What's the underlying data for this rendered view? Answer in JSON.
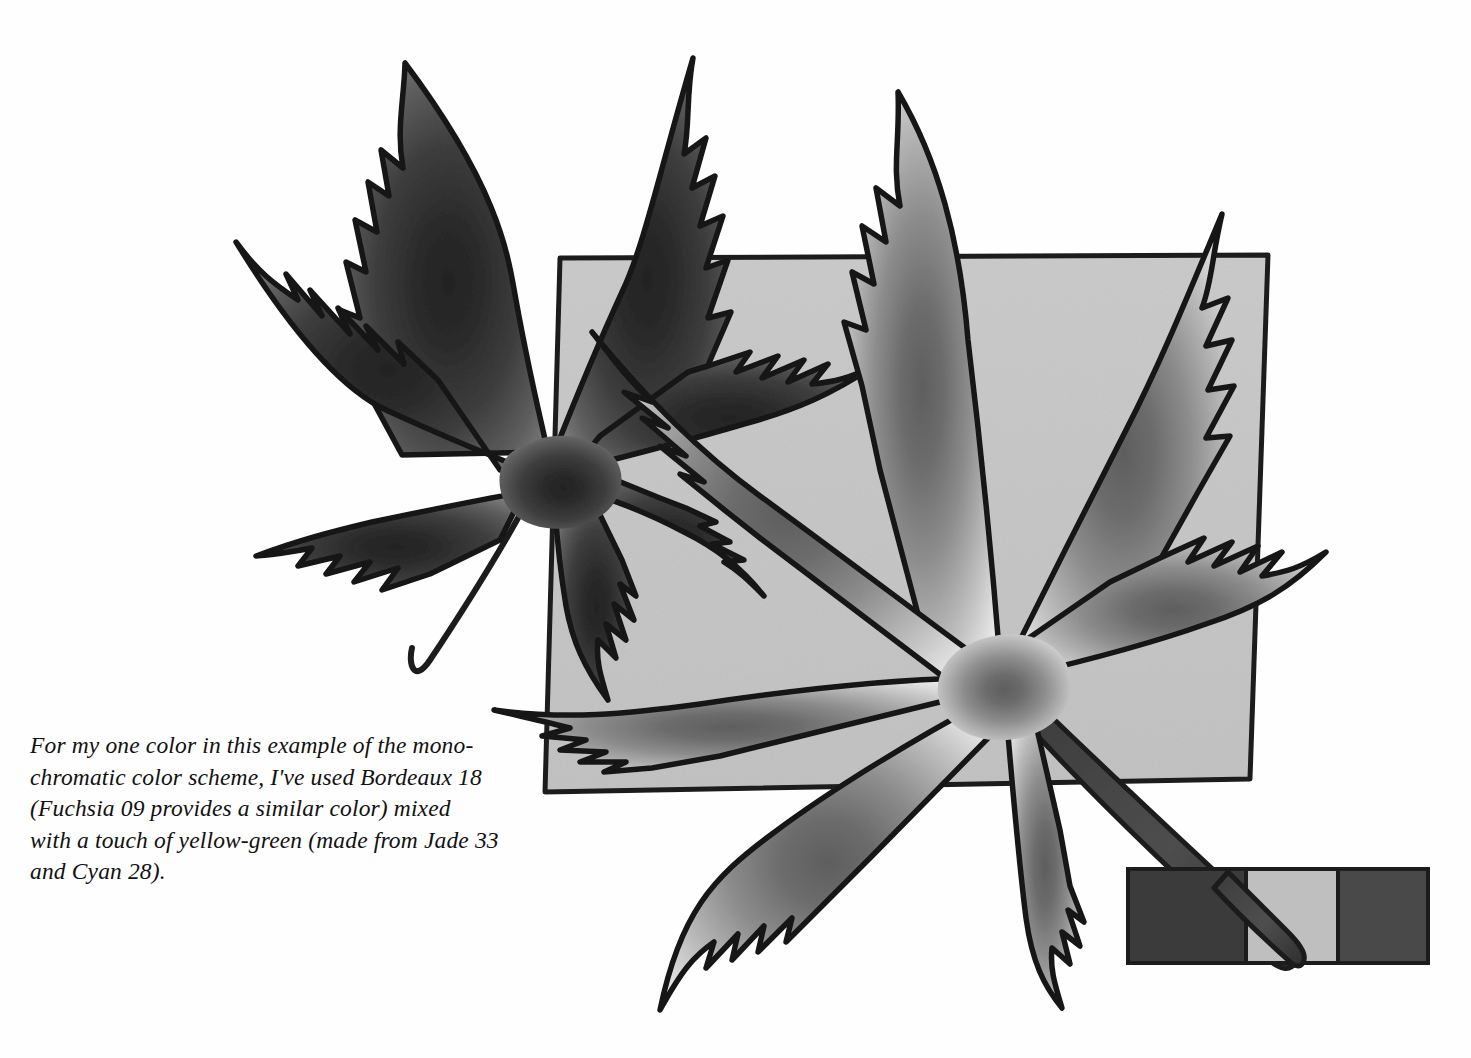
{
  "page": {
    "kind": "book-illustration-plate",
    "background_color": "#fefefe",
    "width": 1471,
    "height": 1058
  },
  "caption": {
    "text": "For my one color in this example of the mono-\nchromatic color scheme, I've used Bordeaux 18\n(Fuchsia 09 provides a similar color) mixed\nwith a touch of yellow-green (made from Jade 33\nand Cyan 28).",
    "lines": [
      "For my one color in this example of the mono-",
      "chromatic color scheme, I've used Bordeaux 18",
      "(Fuchsia 09 provides a similar color) mixed",
      "with a touch of yellow-green (made from Jade 33",
      "and Cyan 28)."
    ],
    "style": "italic-serif",
    "color": "#111111"
  },
  "artwork": {
    "title": "two-japanese-maple-leaves-over-gray-square",
    "background_square": {
      "fill": "#c7c7c7",
      "stroke": "#1a1a1a",
      "corners": "545,792 560,258 1268,255 1250,779"
    },
    "leaves": [
      {
        "name": "dark-leaf-upper-left",
        "tone": "dark",
        "center_fill": "#2a2a2a",
        "tip_fill": "#8d8d8d",
        "outline": "#141414",
        "stem": "thin-curved-down-left"
      },
      {
        "name": "light-leaf-lower-right",
        "tone": "light",
        "center_fill": "#6e6e6e",
        "tip_fill": "#f2f2f2",
        "outline": "#141414",
        "stem": "thick-tapered-down-right"
      }
    ]
  },
  "swatch_bar": {
    "name": "monochromatic-color-swatch-strip",
    "cells": [
      {
        "label": "swatch-dark-left",
        "color": "#3b3b3b",
        "x": 0,
        "width": 118
      },
      {
        "label": "swatch-light-mid",
        "color": "#c2c2c2",
        "x": 118,
        "width": 92
      },
      {
        "label": "swatch-dark-right",
        "color": "#4a4a4a",
        "x": 210,
        "width": 90
      }
    ],
    "stroke": "#1d1d1d"
  },
  "palette": {
    "paper_white": "#fefefe",
    "square_gray": "#c7c7c7",
    "ink_black": "#141414",
    "mid_gray": "#6e6e6e",
    "deep_gray": "#2a2a2a"
  }
}
